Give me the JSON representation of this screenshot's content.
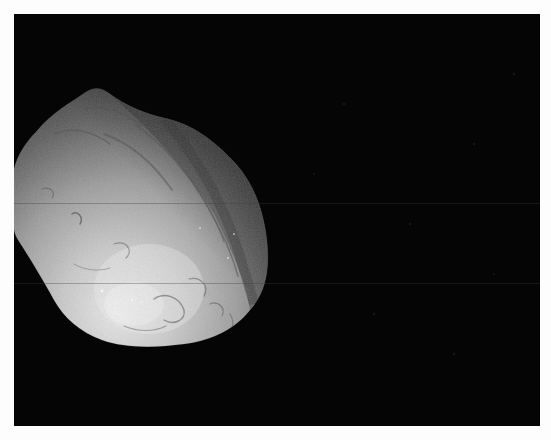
{
  "image": {
    "subject": "comet nucleus",
    "description": "Grayscale spacecraft image of an irregular comet nucleus against a black starless background, lit from the lower-left, partially cut off at the left edge of the frame.",
    "background_color": "#050505",
    "border_color": "#fdfdfd",
    "nucleus": {
      "shape": "irregular-rounded",
      "lit_color": "#c8c8c8",
      "highlight_color": "#e6e6e6",
      "shadow_color": "#3a3a3a",
      "terminator_side": "upper-right"
    },
    "artifacts": {
      "scan_lines": [
        189,
        269
      ]
    }
  }
}
